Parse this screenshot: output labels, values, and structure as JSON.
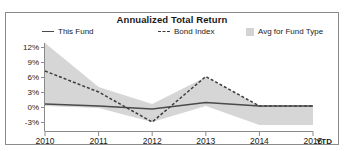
{
  "chart_data": {
    "type": "line",
    "title": "Annualized Total Return",
    "xlabel": "",
    "ylabel": "",
    "grid": false,
    "legend_position": "top",
    "x": [
      "2010",
      "2011",
      "2012",
      "2013",
      "2014",
      "2015"
    ],
    "x_extra_label": "YTD",
    "ylim": [
      -3,
      12
    ],
    "yticks": [
      "12%",
      "9%",
      "6%",
      "3%",
      "0%",
      "-3%"
    ],
    "ytick_values": [
      12,
      9,
      6,
      3,
      0,
      -3
    ],
    "series": [
      {
        "name": "This Fund",
        "style": "solid",
        "color": "#4a4a4a",
        "values": [
          0.6,
          0.2,
          -0.4,
          0.9,
          0.2,
          0.2
        ]
      },
      {
        "name": "Bond Index",
        "style": "dashed",
        "color": "#3b3b3b",
        "values": [
          7.2,
          3.0,
          -3.0,
          6.1,
          0.2,
          0.2
        ]
      },
      {
        "name": "Avg for Fund Type",
        "style": "band",
        "color": "#d3d3d3",
        "band_upper": [
          12.8,
          4.0,
          0.6,
          6.0,
          0.2,
          0.2
        ],
        "band_lower": [
          0.2,
          -0.2,
          -3.0,
          0.2,
          -3.6,
          -3.6
        ]
      }
    ]
  },
  "legend": {
    "this_fund": "This Fund",
    "bond_index": "Bond Index",
    "avg_for_fund_type": "Avg for Fund Type"
  },
  "icons": {
    "line_swatch": "solid-line-swatch-icon",
    "dash_swatch": "dashed-line-swatch-icon",
    "box_swatch": "filled-square-swatch-icon"
  }
}
